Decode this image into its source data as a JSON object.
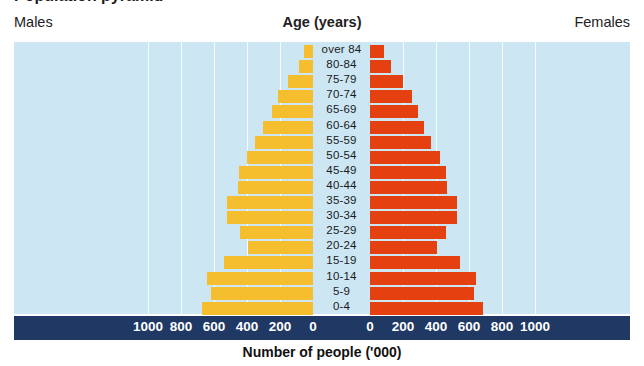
{
  "title_sliver": "Population pyramid",
  "header": {
    "males_label": "Males",
    "females_label": "Females",
    "age_title": "Age (years)"
  },
  "axis": {
    "caption": "Number of people  ('000)",
    "ticks_left": [
      "1000",
      "800",
      "600",
      "400",
      "200",
      "0"
    ],
    "ticks_right": [
      "0",
      "200",
      "400",
      "600",
      "800",
      "1000"
    ]
  },
  "colors": {
    "male_bar": "#f5be2e",
    "female_bar": "#e54010",
    "plot_background": "#cde6f4",
    "axis_bar": "#1f3864",
    "gridline": "#ffffff"
  },
  "chart_data": {
    "type": "bar",
    "subtype": "population-pyramid",
    "title": "Age (years)",
    "xlabel": "Number of people  ('000)",
    "ylabel": "Age (years)",
    "xlim": [
      0,
      1000
    ],
    "grid": true,
    "legend_position": "top-outside",
    "categories": [
      "over 84",
      "80-84",
      "75-79",
      "70-74",
      "65-69",
      "60-64",
      "55-59",
      "50-54",
      "45-49",
      "40-44",
      "35-39",
      "30-34",
      "25-29",
      "20-24",
      "15-19",
      "10-14",
      "5-9",
      "0-4"
    ],
    "series": [
      {
        "name": "Males",
        "color": "#f5be2e",
        "direction": "left",
        "values": [
          55,
          85,
          150,
          215,
          250,
          305,
          350,
          400,
          450,
          455,
          520,
          520,
          445,
          395,
          540,
          640,
          620,
          670
        ]
      },
      {
        "name": "Females",
        "color": "#e54010",
        "direction": "right",
        "values": [
          85,
          130,
          200,
          255,
          290,
          325,
          370,
          425,
          460,
          465,
          530,
          530,
          460,
          405,
          545,
          645,
          630,
          685
        ]
      }
    ]
  }
}
